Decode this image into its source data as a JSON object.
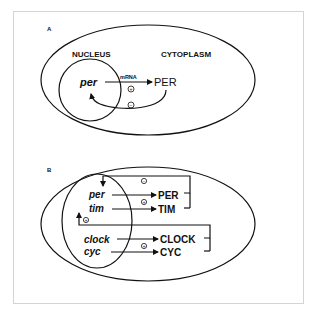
{
  "panels": {
    "a": {
      "label": "A",
      "compartments": {
        "nucleus": "NUCLEUS",
        "cytoplasm": "CYTOPLASM"
      },
      "gene": "per",
      "transcript_label": "mRNA",
      "protein": "PER",
      "activation_sign": "+",
      "repression_sign": "−"
    },
    "b": {
      "label": "B",
      "genes": {
        "per": "per",
        "tim": "tim",
        "clock": "clock",
        "cyc": "cyc"
      },
      "proteins": {
        "per": "PER",
        "tim": "TIM",
        "clock": "CLOCK",
        "cyc": "CYC"
      },
      "signs": {
        "per_tim_translation": "+",
        "clock_cyc_translation": "+",
        "per_tim_feedback": "−",
        "clock_cyc_feedback": "+"
      }
    }
  },
  "colors": {
    "ink": "#111111",
    "frame": "#d4d4d4",
    "background": "#ffffff"
  }
}
